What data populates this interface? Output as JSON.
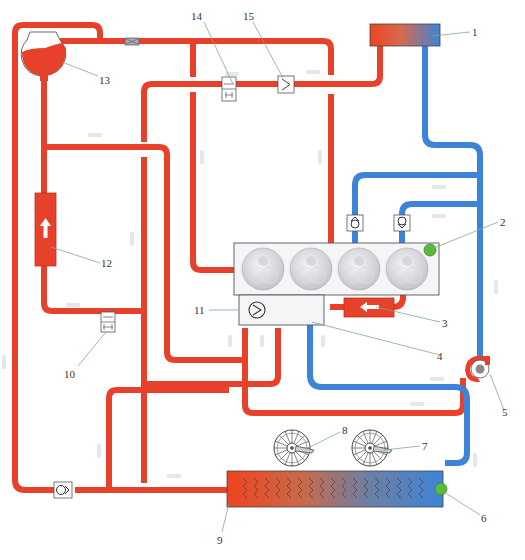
{
  "diagram": {
    "colors": {
      "hot_line": "#e8412b",
      "cold_line": "#3d84d8",
      "sensor_green": "#5cb83a",
      "engine_block": "#f4f5f7",
      "outline": "#555555"
    },
    "legend_colors": {
      "hot": "red = hot coolant",
      "cold": "blue = cold coolant"
    },
    "callouts": [
      {
        "id": "1",
        "label": "1",
        "component": "radiator / expansion heat exchanger (top right)"
      },
      {
        "id": "2",
        "label": "2",
        "component": "temperature sensor on engine block"
      },
      {
        "id": "3",
        "label": "3",
        "component": "oil cooler / heat exchanger"
      },
      {
        "id": "4",
        "label": "4",
        "component": "coolant distribution housing"
      },
      {
        "id": "5",
        "label": "5",
        "component": "coolant pump"
      },
      {
        "id": "6",
        "label": "6",
        "component": "radiator outlet temperature sensor"
      },
      {
        "id": "7",
        "label": "7",
        "component": "radiator fan 2"
      },
      {
        "id": "8",
        "label": "8",
        "component": "radiator fan 1"
      },
      {
        "id": "9",
        "label": "9",
        "component": "main radiator"
      },
      {
        "id": "10",
        "label": "10",
        "component": "shut-off valve"
      },
      {
        "id": "11",
        "label": "11",
        "component": "thermostat"
      },
      {
        "id": "12",
        "label": "12",
        "component": "heater core"
      },
      {
        "id": "13",
        "label": "13",
        "component": "expansion tank"
      },
      {
        "id": "14",
        "label": "14",
        "component": "shut-off valve"
      },
      {
        "id": "15",
        "label": "15",
        "component": "check valve"
      }
    ],
    "engine": {
      "cylinders": 4
    }
  }
}
